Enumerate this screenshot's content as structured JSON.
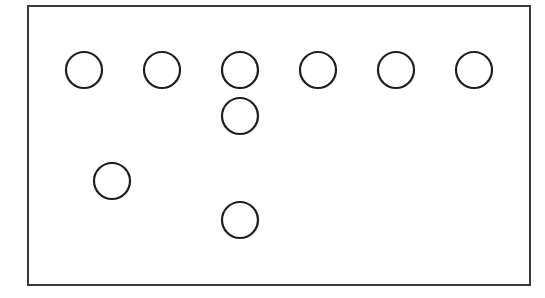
{
  "colors": {
    "background": "#ffffff",
    "stroke": "#1f1f1f",
    "border": "#3a3a3a"
  },
  "frame": {
    "x": 28,
    "y": 6,
    "width": 502,
    "height": 279,
    "stroke_width": 2
  },
  "circle_radius": 18,
  "circle_stroke_width": 2.2,
  "circles": [
    {
      "id": "top-row-1",
      "cx": 84,
      "cy": 70
    },
    {
      "id": "top-row-2",
      "cx": 162,
      "cy": 70
    },
    {
      "id": "top-row-3",
      "cx": 240,
      "cy": 70
    },
    {
      "id": "top-row-4",
      "cx": 318,
      "cy": 70
    },
    {
      "id": "top-row-5",
      "cx": 396,
      "cy": 70
    },
    {
      "id": "top-row-6",
      "cx": 474,
      "cy": 70
    },
    {
      "id": "below-3",
      "cx": 240,
      "cy": 116
    },
    {
      "id": "left-mid",
      "cx": 112,
      "cy": 181
    },
    {
      "id": "bottom-3",
      "cx": 240,
      "cy": 220
    }
  ]
}
